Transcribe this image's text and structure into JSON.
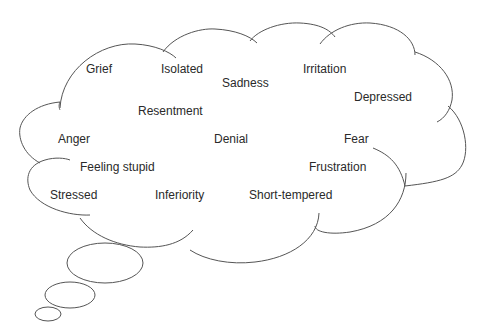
{
  "diagram": {
    "type": "thought-bubble",
    "stroke_color": "#555555",
    "text_color": "#2a2a2a",
    "emotions": [
      {
        "label": "Grief",
        "x": 86,
        "y": 62
      },
      {
        "label": "Isolated",
        "x": 161,
        "y": 62
      },
      {
        "label": "Sadness",
        "x": 222,
        "y": 76
      },
      {
        "label": "Irritation",
        "x": 303,
        "y": 62
      },
      {
        "label": "Depressed",
        "x": 354,
        "y": 90
      },
      {
        "label": "Resentment",
        "x": 138,
        "y": 104
      },
      {
        "label": "Anger",
        "x": 58,
        "y": 132
      },
      {
        "label": "Denial",
        "x": 214,
        "y": 132
      },
      {
        "label": "Fear",
        "x": 344,
        "y": 132
      },
      {
        "label": "Feeling stupid",
        "x": 80,
        "y": 160
      },
      {
        "label": "Frustration",
        "x": 309,
        "y": 160
      },
      {
        "label": "Stressed",
        "x": 50,
        "y": 188
      },
      {
        "label": "Inferiority",
        "x": 155,
        "y": 188
      },
      {
        "label": "Short-tempered",
        "x": 249,
        "y": 188
      }
    ],
    "trailing_bubbles": 3
  }
}
